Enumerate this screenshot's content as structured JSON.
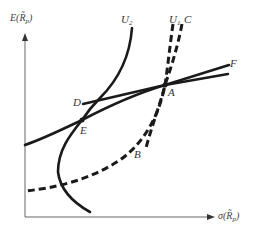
{
  "figure": {
    "axes": {
      "y_label_prefix": "E(",
      "y_label_var": "R̃",
      "y_label_sub": "p",
      "y_label_suffix": ")",
      "x_label_prefix": "σ(",
      "x_label_var": "R̃",
      "x_label_sub": "p",
      "x_label_suffix": ")"
    },
    "curve_labels": {
      "u2": "U",
      "u2_sub": "2",
      "u1": "U",
      "u1_sub": "1",
      "c": "C",
      "f": "F"
    },
    "point_labels": {
      "a": "A",
      "b": "B",
      "d": "D",
      "e": "E"
    },
    "colors": {
      "line": "#1a1a1a",
      "axis": "#555555",
      "text": "#333333"
    }
  }
}
